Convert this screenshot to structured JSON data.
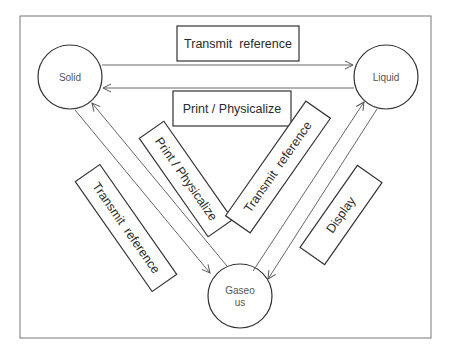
{
  "diagram": {
    "nodes": {
      "solid": {
        "label": "Solid"
      },
      "liquid": {
        "label": "Liquid"
      },
      "gaseous": {
        "label_line1": "Gaseo",
        "label_line2": "us"
      }
    },
    "edges": {
      "solid_to_liquid": {
        "label": "Transmit  reference"
      },
      "liquid_to_solid": {
        "label": "Print / Physicalize"
      },
      "gaseous_to_solid": {
        "label": "Print / Physicalize"
      },
      "solid_to_gaseous": {
        "label": "Transmit  reference"
      },
      "gaseous_to_liquid": {
        "label": "Transmit  reference"
      },
      "liquid_to_gaseous": {
        "label": "Display"
      }
    },
    "colors": {
      "frame": "#777777",
      "stroke": "#333333",
      "arrow": "#666666"
    }
  }
}
